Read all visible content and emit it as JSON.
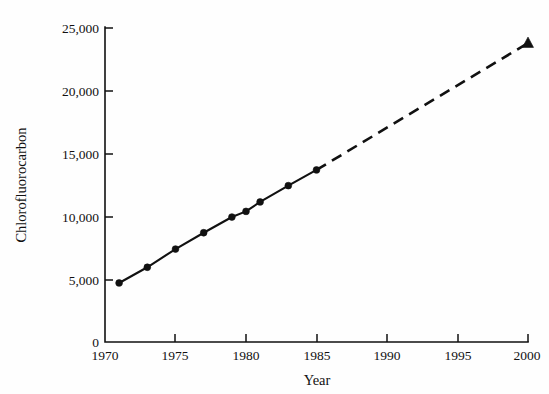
{
  "chart_data": {
    "type": "line",
    "title": "",
    "xlabel": "Year",
    "ylabel": "Chlorofluorocarbon",
    "xlim": [
      1970,
      2000
    ],
    "ylim": [
      0,
      25000
    ],
    "grid": false,
    "legend": null,
    "x_ticks": [
      1970,
      1975,
      1980,
      1985,
      1990,
      1995,
      2000
    ],
    "x_tick_labels": [
      "1970",
      "1975",
      "1980",
      "1985",
      "1990",
      "1995",
      "2000"
    ],
    "y_ticks": [
      0,
      5000,
      10000,
      15000,
      20000,
      25000
    ],
    "y_tick_labels": [
      "0",
      "5,000",
      "10,000",
      "15,000",
      "20,000",
      "25,000"
    ],
    "series": [
      {
        "name": "observed",
        "line_style": "solid",
        "marker": "circle",
        "x": [
          1971,
          1973,
          1975,
          1977,
          1979,
          1980,
          1981,
          1983,
          1985
        ],
        "values": [
          4700,
          5950,
          7400,
          8700,
          9950,
          10400,
          11150,
          12450,
          13700
        ]
      },
      {
        "name": "projected",
        "line_style": "dashed",
        "marker": "triangle",
        "x": [
          1985,
          2000
        ],
        "values": [
          13700,
          23800
        ]
      }
    ],
    "colors": {
      "line": "#111111",
      "marker": "#111111",
      "axis": "#111111",
      "background": "#fefefe"
    }
  }
}
